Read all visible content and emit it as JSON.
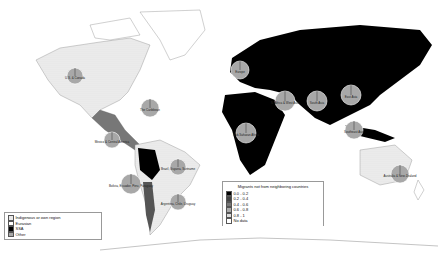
{
  "colors": {
    "ocean": "#ffffff",
    "black": "#000000",
    "pie_grey": "#a8a8a8",
    "land_light": "#e6e6e6",
    "dark_grey": "#555555",
    "mid_grey": "#777777"
  },
  "legend_composition": {
    "items": [
      {
        "label": "Indigenous or own region",
        "fill": "#e8e8e8"
      },
      {
        "label": "Eurasian",
        "fill": "#ffffff"
      },
      {
        "label": "SSA",
        "fill": "#000000"
      },
      {
        "label": "Other",
        "fill": "#a8a8a8"
      }
    ]
  },
  "legend_migrants": {
    "title": "Migrants not from neighboring countries",
    "items": [
      {
        "label": "0.0 - 0.2",
        "fill": "#000000"
      },
      {
        "label": "0.2 - 0.4",
        "fill": "#444444"
      },
      {
        "label": "0.4 - 0.6",
        "fill": "#777777"
      },
      {
        "label": "0.6 - 0.8",
        "fill": "#aaaaaa"
      },
      {
        "label": "0.8 - 1",
        "fill": "#dddddd"
      },
      {
        "label": "No data",
        "fill": "#ffffff"
      }
    ]
  },
  "pies": [
    {
      "label": "U.S. & Canada",
      "x": 75,
      "y": 76,
      "r": 8
    },
    {
      "label": "The Caribbean",
      "x": 150,
      "y": 108,
      "r": 9
    },
    {
      "label": "Mexico & Central America",
      "x": 112,
      "y": 140,
      "r": 8
    },
    {
      "label": "Brazil, Guyana, Suriname",
      "x": 178,
      "y": 167,
      "r": 8
    },
    {
      "label": "Bolivia, Ecuador, Peru, Paraguay",
      "x": 131,
      "y": 184,
      "r": 10
    },
    {
      "label": "Argentina, Chile, Uruguay",
      "x": 178,
      "y": 202,
      "r": 8
    },
    {
      "label": "Europe",
      "x": 240,
      "y": 70,
      "r": 9
    },
    {
      "label": "N. Africa & West Asia",
      "x": 285,
      "y": 101,
      "r": 10
    },
    {
      "label": "South Asia",
      "x": 317,
      "y": 101,
      "r": 10
    },
    {
      "label": "East Asia",
      "x": 351,
      "y": 95,
      "r": 10
    },
    {
      "label": "Sub-Saharan Africa",
      "x": 246,
      "y": 133,
      "r": 10
    },
    {
      "label": "Southeast Asia",
      "x": 354,
      "y": 130,
      "r": 9
    },
    {
      "label": "Australia & New Zealand",
      "x": 400,
      "y": 174,
      "r": 9
    }
  ]
}
